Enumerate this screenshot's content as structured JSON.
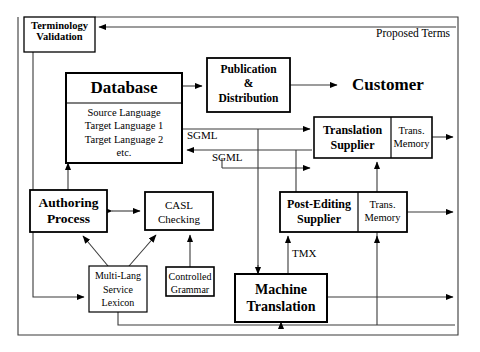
{
  "diagram": {
    "title": "Proposed Terms",
    "outer_frame_label": "Proposed Terms",
    "nodes": {
      "terminology_validation": {
        "line1": "Terminology",
        "line2": "Validation"
      },
      "database": {
        "title": "Database",
        "detail1": "Source Language",
        "detail2": "Target Language 1",
        "detail3": "Target Language 2",
        "detail4": "etc."
      },
      "publication_distribution": {
        "line1": "Publication",
        "line2": "&",
        "line3": "Distribution"
      },
      "customer": {
        "label": "Customer"
      },
      "translation_supplier": {
        "title_line1": "Translation",
        "title_line2": "Supplier",
        "memory_line1": "Trans.",
        "memory_line2": "Memory"
      },
      "post_editing_supplier": {
        "title_line1": "Post-Editing",
        "title_line2": "Supplier",
        "memory_line1": "Trans.",
        "memory_line2": "Memory"
      },
      "authoring_process": {
        "line1": "Authoring",
        "line2": "Process"
      },
      "casl_checking": {
        "line1": "CASL",
        "line2": "Checking"
      },
      "multi_lang_service_lexicon": {
        "line1": "Multi-Lang",
        "line2": "Service",
        "line3": "Lexicon"
      },
      "controlled_grammar": {
        "line1": "Controlled",
        "line2": "Grammar"
      },
      "machine_translation": {
        "line1": "Machine",
        "line2": "Translation"
      }
    },
    "edge_labels": {
      "sgml_upper": "SGML",
      "sgml_lower": "SGML",
      "tmx": "TMX"
    },
    "colors": {
      "stroke": "#000000",
      "box_fill": "#ffffff",
      "background": "#ffffff",
      "text": "#000000",
      "thin_line": "#3a3a3a"
    }
  }
}
